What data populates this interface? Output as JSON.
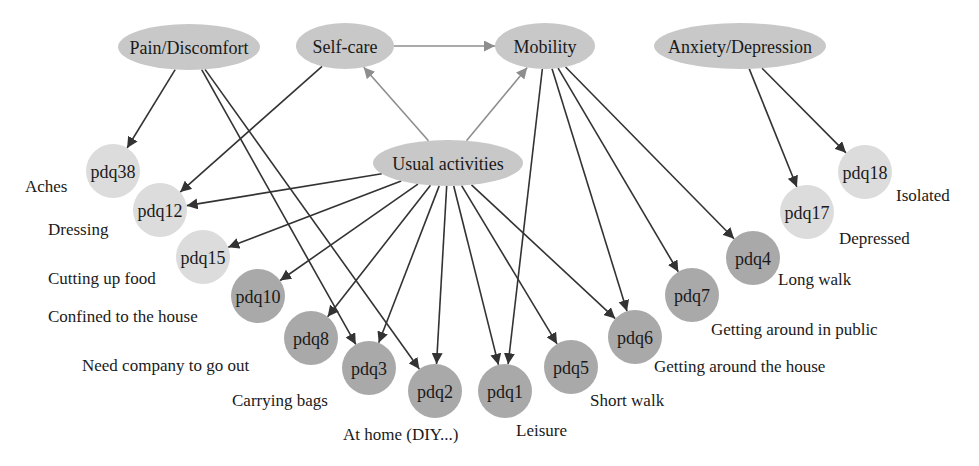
{
  "colors": {
    "dimension_fill": "#c8c8c8",
    "item_light_fill": "#dcdcdc",
    "item_dark_fill": "#a9a9a9",
    "edge_dark": "#333333",
    "edge_light": "#8e8e8e",
    "text": "#1a1a1a"
  },
  "dimensions": [
    {
      "id": "pain",
      "label": "Pain/Discomfort",
      "cx": 189,
      "cy": 47,
      "rx": 71,
      "ry": 23
    },
    {
      "id": "selfcare",
      "label": "Self-care",
      "cx": 345,
      "cy": 46,
      "rx": 49,
      "ry": 23
    },
    {
      "id": "mobility",
      "label": "Mobility",
      "cx": 545,
      "cy": 46,
      "rx": 50,
      "ry": 23
    },
    {
      "id": "anxiety",
      "label": "Anxiety/Depression",
      "cx": 740,
      "cy": 46,
      "rx": 86,
      "ry": 23
    },
    {
      "id": "usual",
      "label": "Usual activities",
      "cx": 448,
      "cy": 163,
      "rx": 75,
      "ry": 23
    }
  ],
  "items": [
    {
      "id": "pdq38",
      "label": "pdq38",
      "description": "Aches",
      "cx": 113,
      "cy": 171,
      "shade": "light",
      "desc_x": 25,
      "desc_y": 186,
      "desc_anchor": "start"
    },
    {
      "id": "pdq12",
      "label": "pdq12",
      "description": "Dressing",
      "cx": 160,
      "cy": 210,
      "shade": "light",
      "desc_x": 48,
      "desc_y": 229,
      "desc_anchor": "start"
    },
    {
      "id": "pdq15",
      "label": "pdq15",
      "description": "Cutting up food",
      "cx": 203,
      "cy": 257,
      "shade": "light",
      "desc_x": 48,
      "desc_y": 278,
      "desc_anchor": "start"
    },
    {
      "id": "pdq10",
      "label": "pdq10",
      "description": "Confined to the house",
      "cx": 258,
      "cy": 296,
      "shade": "dark",
      "desc_x": 48,
      "desc_y": 316,
      "desc_anchor": "start"
    },
    {
      "id": "pdq8",
      "label": "pdq8",
      "description": "Need company to go out",
      "cx": 311,
      "cy": 338,
      "shade": "dark",
      "desc_x": 82,
      "desc_y": 365,
      "desc_anchor": "start"
    },
    {
      "id": "pdq3",
      "label": "pdq3",
      "description": "Carrying bags",
      "cx": 369,
      "cy": 368,
      "shade": "dark",
      "desc_x": 232,
      "desc_y": 400,
      "desc_anchor": "start"
    },
    {
      "id": "pdq2",
      "label": "pdq2",
      "description": "At home (DIY...)",
      "cx": 435,
      "cy": 391,
      "shade": "dark",
      "desc_x": 343,
      "desc_y": 434,
      "desc_anchor": "start"
    },
    {
      "id": "pdq1",
      "label": "pdq1",
      "description": "Leisure",
      "cx": 505,
      "cy": 391,
      "shade": "dark",
      "desc_x": 516,
      "desc_y": 430,
      "desc_anchor": "start"
    },
    {
      "id": "pdq5",
      "label": "pdq5",
      "description": "Short walk",
      "cx": 571,
      "cy": 367,
      "shade": "dark",
      "desc_x": 590,
      "desc_y": 400,
      "desc_anchor": "start"
    },
    {
      "id": "pdq6",
      "label": "pdq6",
      "description": "Getting around the house",
      "cx": 635,
      "cy": 337,
      "shade": "dark",
      "desc_x": 654,
      "desc_y": 366,
      "desc_anchor": "start"
    },
    {
      "id": "pdq7",
      "label": "pdq7",
      "description": "Getting around in public",
      "cx": 692,
      "cy": 295,
      "shade": "dark",
      "desc_x": 711,
      "desc_y": 329,
      "desc_anchor": "start"
    },
    {
      "id": "pdq4",
      "label": "pdq4",
      "description": "Long walk",
      "cx": 753,
      "cy": 258,
      "shade": "dark",
      "desc_x": 778,
      "desc_y": 279,
      "desc_anchor": "start"
    },
    {
      "id": "pdq17",
      "label": "pdq17",
      "description": "Depressed",
      "cx": 807,
      "cy": 212,
      "shade": "light",
      "desc_x": 839,
      "desc_y": 238,
      "desc_anchor": "start"
    },
    {
      "id": "pdq18",
      "label": "pdq18",
      "description": "Isolated",
      "cx": 865,
      "cy": 172,
      "shade": "light",
      "desc_x": 896,
      "desc_y": 195,
      "desc_anchor": "start"
    }
  ],
  "item_radius": 27,
  "edges": [
    {
      "from": "selfcare",
      "to": "mobility",
      "style": "light"
    },
    {
      "from": "usual",
      "to": "selfcare",
      "style": "light"
    },
    {
      "from": "usual",
      "to": "mobility",
      "style": "light"
    },
    {
      "from": "pain",
      "to": "pdq38",
      "style": "dark"
    },
    {
      "from": "pain",
      "to": "pdq3",
      "style": "dark"
    },
    {
      "from": "pain",
      "to": "pdq2",
      "style": "dark"
    },
    {
      "from": "selfcare",
      "to": "pdq12",
      "style": "dark"
    },
    {
      "from": "usual",
      "to": "pdq12",
      "style": "dark"
    },
    {
      "from": "usual",
      "to": "pdq15",
      "style": "dark"
    },
    {
      "from": "usual",
      "to": "pdq10",
      "style": "dark"
    },
    {
      "from": "usual",
      "to": "pdq8",
      "style": "dark"
    },
    {
      "from": "usual",
      "to": "pdq3",
      "style": "dark"
    },
    {
      "from": "usual",
      "to": "pdq2",
      "style": "dark"
    },
    {
      "from": "usual",
      "to": "pdq1",
      "style": "dark"
    },
    {
      "from": "usual",
      "to": "pdq5",
      "style": "dark"
    },
    {
      "from": "usual",
      "to": "pdq6",
      "style": "dark"
    },
    {
      "from": "mobility",
      "to": "pdq1",
      "style": "dark"
    },
    {
      "from": "mobility",
      "to": "pdq6",
      "style": "dark"
    },
    {
      "from": "mobility",
      "to": "pdq7",
      "style": "dark"
    },
    {
      "from": "mobility",
      "to": "pdq4",
      "style": "dark"
    },
    {
      "from": "anxiety",
      "to": "pdq17",
      "style": "dark"
    },
    {
      "from": "anxiety",
      "to": "pdq18",
      "style": "dark"
    }
  ]
}
